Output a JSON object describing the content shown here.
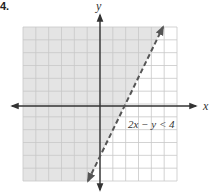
{
  "problem_number": "4.",
  "chart_data": {
    "type": "line",
    "title": "",
    "xlabel": "x",
    "ylabel": "y",
    "inequality_label": "2x − y < 4",
    "boundary": {
      "equation": "2x - y = 4",
      "style": "dashed",
      "slope": 2,
      "y_intercept": -4,
      "x_intercept": 2
    },
    "shaded_region": "above-left of boundary (2x − y < 4)",
    "xlim": [
      -6,
      6
    ],
    "ylim": [
      -6,
      6
    ],
    "grid": true,
    "grid_step": 1,
    "tick_labels": false
  },
  "colors": {
    "shade": "#e4e4e4",
    "grid": "#c8c8c8",
    "axis": "#333333",
    "boundary": "#555555"
  }
}
